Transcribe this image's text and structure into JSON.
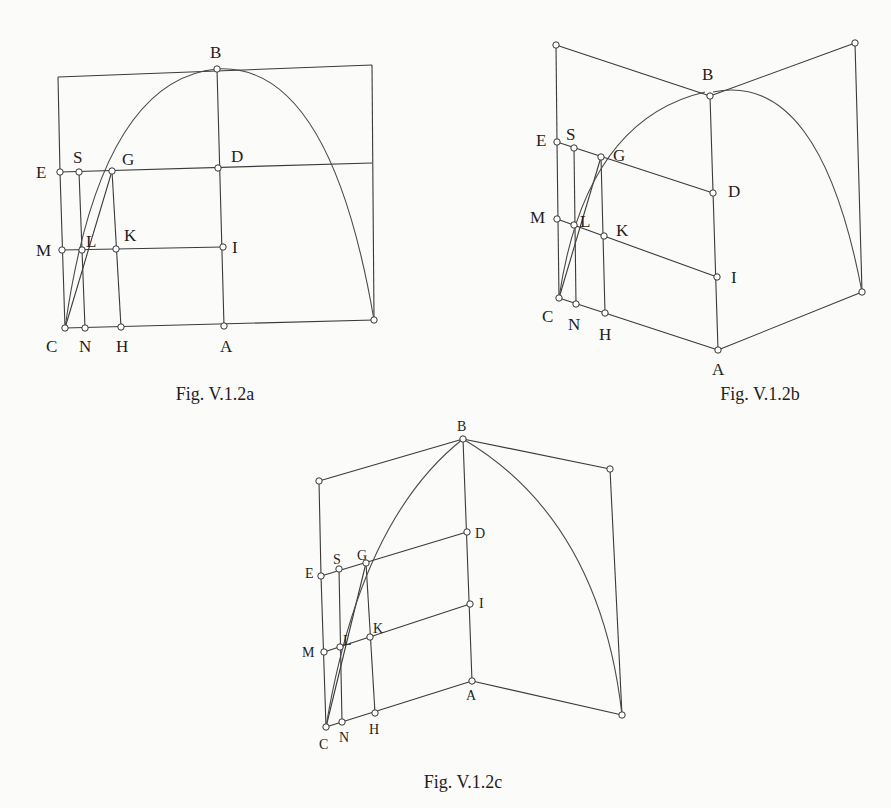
{
  "page": {
    "background": "#fbfbf9",
    "ink": "#333333"
  },
  "figures": [
    {
      "id": "a",
      "caption": "Fig. V.1.2a",
      "caption_pos": [
        215,
        400
      ],
      "label_class": "lbl",
      "edges": [
        [
          [
            58,
            77
          ],
          [
            372,
            65
          ]
        ],
        [
          [
            372,
            65
          ],
          [
            374,
            320
          ]
        ],
        [
          [
            58,
            77
          ],
          [
            60,
            172
          ]
        ],
        [
          [
            60,
            172
          ],
          [
            65,
            328
          ]
        ],
        [
          [
            65,
            328
          ],
          [
            374,
            320
          ]
        ],
        [
          [
            60,
            172
          ],
          [
            372,
            163
          ]
        ],
        [
          [
            62,
            250
          ],
          [
            223,
            247
          ]
        ],
        [
          [
            79,
            172
          ],
          [
            85,
            328
          ]
        ],
        [
          [
            112,
            171
          ],
          [
            121,
            327
          ]
        ],
        [
          [
            217,
            69
          ],
          [
            224,
            326
          ]
        ],
        [
          [
            65,
            328
          ],
          [
            112,
            171
          ]
        ]
      ],
      "curve": "M 65 328 Q 100 80 217 69 Q 330 62 374 320",
      "points": [
        {
          "name": "B",
          "xy": [
            217,
            69
          ],
          "label_xy": [
            210,
            58
          ]
        },
        {
          "name": "E",
          "xy": [
            60,
            172
          ],
          "label_xy": [
            36,
            178
          ]
        },
        {
          "name": "S",
          "xy": [
            79,
            172
          ],
          "label_xy": [
            73,
            163
          ]
        },
        {
          "name": "G",
          "xy": [
            112,
            171
          ],
          "label_xy": [
            122,
            165
          ]
        },
        {
          "name": "D",
          "xy": [
            218,
            168
          ],
          "label_xy": [
            231,
            162
          ]
        },
        {
          "name": "M",
          "xy": [
            62,
            250
          ],
          "label_xy": [
            36,
            256
          ]
        },
        {
          "name": "L",
          "xy": [
            82,
            250
          ],
          "label_xy": [
            86,
            247
          ]
        },
        {
          "name": "K",
          "xy": [
            116,
            249
          ],
          "label_xy": [
            124,
            241
          ]
        },
        {
          "name": "I",
          "xy": [
            223,
            247
          ],
          "label_xy": [
            232,
            253
          ]
        },
        {
          "name": "C",
          "xy": [
            65,
            328
          ],
          "label_xy": [
            46,
            352
          ]
        },
        {
          "name": "N",
          "xy": [
            85,
            328
          ],
          "label_xy": [
            79,
            352
          ]
        },
        {
          "name": "H",
          "xy": [
            121,
            327
          ],
          "label_xy": [
            116,
            352
          ]
        },
        {
          "name": "A",
          "xy": [
            224,
            326
          ],
          "label_xy": [
            220,
            352
          ]
        },
        {
          "name": "",
          "xy": [
            374,
            320
          ],
          "label_xy": null
        }
      ]
    },
    {
      "id": "b",
      "caption": "Fig. V.1.2b",
      "caption_pos": [
        760,
        400
      ],
      "label_class": "lbl",
      "edges": [
        [
          [
            556,
            45
          ],
          [
            710,
            96
          ]
        ],
        [
          [
            710,
            96
          ],
          [
            855,
            43
          ]
        ],
        [
          [
            556,
            45
          ],
          [
            557,
            142
          ]
        ],
        [
          [
            557,
            142
          ],
          [
            559,
            298
          ]
        ],
        [
          [
            855,
            43
          ],
          [
            862,
            292
          ]
        ],
        [
          [
            710,
            96
          ],
          [
            718,
            350
          ]
        ],
        [
          [
            559,
            298
          ],
          [
            718,
            350
          ]
        ],
        [
          [
            718,
            350
          ],
          [
            862,
            292
          ]
        ],
        [
          [
            557,
            142
          ],
          [
            713,
            193
          ]
        ],
        [
          [
            557,
            219
          ],
          [
            717,
            277
          ]
        ],
        [
          [
            574,
            148
          ],
          [
            576,
            304
          ]
        ],
        [
          [
            601,
            157
          ],
          [
            605,
            313
          ]
        ],
        [
          [
            559,
            298
          ],
          [
            601,
            157
          ]
        ]
      ],
      "curve": "M 559 298 Q 585 120 705 92 M 713 92 Q 820 70 862 292",
      "points": [
        {
          "name": "",
          "xy": [
            556,
            45
          ],
          "label_xy": null
        },
        {
          "name": "",
          "xy": [
            855,
            43
          ],
          "label_xy": null
        },
        {
          "name": "B",
          "xy": [
            710,
            96
          ],
          "label_xy": [
            702,
            80
          ]
        },
        {
          "name": "E",
          "xy": [
            557,
            142
          ],
          "label_xy": [
            536,
            146
          ]
        },
        {
          "name": "S",
          "xy": [
            574,
            148
          ],
          "label_xy": [
            566,
            140
          ]
        },
        {
          "name": "G",
          "xy": [
            601,
            157
          ],
          "label_xy": [
            613,
            161
          ]
        },
        {
          "name": "D",
          "xy": [
            713,
            193
          ],
          "label_xy": [
            728,
            197
          ]
        },
        {
          "name": "M",
          "xy": [
            557,
            219
          ],
          "label_xy": [
            530,
            223
          ]
        },
        {
          "name": "L",
          "xy": [
            574,
            225
          ],
          "label_xy": [
            580,
            227
          ]
        },
        {
          "name": "K",
          "xy": [
            604,
            236
          ],
          "label_xy": [
            616,
            236
          ]
        },
        {
          "name": "I",
          "xy": [
            717,
            277
          ],
          "label_xy": [
            731,
            283
          ]
        },
        {
          "name": "C",
          "xy": [
            559,
            298
          ],
          "label_xy": [
            542,
            322
          ]
        },
        {
          "name": "N",
          "xy": [
            576,
            304
          ],
          "label_xy": [
            568,
            330
          ]
        },
        {
          "name": "H",
          "xy": [
            605,
            313
          ],
          "label_xy": [
            599,
            340
          ]
        },
        {
          "name": "A",
          "xy": [
            718,
            350
          ],
          "label_xy": [
            712,
            375
          ]
        },
        {
          "name": "",
          "xy": [
            862,
            292
          ],
          "label_xy": null
        }
      ]
    },
    {
      "id": "c",
      "caption": "Fig. V.1.2c",
      "caption_pos": [
        463,
        788
      ],
      "label_class": "lbl lbl-c",
      "edges": [
        [
          [
            319,
            481
          ],
          [
            463,
            439
          ]
        ],
        [
          [
            463,
            439
          ],
          [
            610,
            469
          ]
        ],
        [
          [
            319,
            481
          ],
          [
            321,
            576
          ]
        ],
        [
          [
            321,
            576
          ],
          [
            326,
            727
          ]
        ],
        [
          [
            610,
            469
          ],
          [
            622,
            715
          ]
        ],
        [
          [
            463,
            439
          ],
          [
            472,
            681
          ]
        ],
        [
          [
            326,
            727
          ],
          [
            472,
            681
          ]
        ],
        [
          [
            472,
            681
          ],
          [
            622,
            715
          ]
        ],
        [
          [
            321,
            576
          ],
          [
            467,
            532
          ]
        ],
        [
          [
            324,
            652
          ],
          [
            470,
            604
          ]
        ],
        [
          [
            339,
            569
          ],
          [
            342,
            722
          ]
        ],
        [
          [
            366,
            563
          ],
          [
            375,
            713
          ]
        ],
        [
          [
            326,
            727
          ],
          [
            366,
            563
          ]
        ]
      ],
      "curve": "M 326 727 Q 360 520 463 439 Q 600 520 622 715",
      "points": [
        {
          "name": "",
          "xy": [
            319,
            481
          ],
          "label_xy": null
        },
        {
          "name": "",
          "xy": [
            610,
            469
          ],
          "label_xy": null
        },
        {
          "name": "B",
          "xy": [
            463,
            439
          ],
          "label_xy": [
            457,
            431
          ]
        },
        {
          "name": "D",
          "xy": [
            467,
            532
          ],
          "label_xy": [
            475,
            538
          ]
        },
        {
          "name": "E",
          "xy": [
            321,
            576
          ],
          "label_xy": [
            305,
            578
          ]
        },
        {
          "name": "S",
          "xy": [
            339,
            569
          ],
          "label_xy": [
            333,
            564
          ]
        },
        {
          "name": "G",
          "xy": [
            366,
            563
          ],
          "label_xy": [
            357,
            560
          ]
        },
        {
          "name": "I",
          "xy": [
            470,
            604
          ],
          "label_xy": [
            479,
            608
          ]
        },
        {
          "name": "K",
          "xy": [
            370,
            637
          ],
          "label_xy": [
            373,
            633
          ]
        },
        {
          "name": "L",
          "xy": [
            340,
            647
          ],
          "label_xy": [
            343,
            645
          ]
        },
        {
          "name": "M",
          "xy": [
            324,
            652
          ],
          "label_xy": [
            302,
            657
          ]
        },
        {
          "name": "A",
          "xy": [
            472,
            681
          ],
          "label_xy": [
            466,
            700
          ]
        },
        {
          "name": "H",
          "xy": [
            375,
            713
          ],
          "label_xy": [
            369,
            734
          ]
        },
        {
          "name": "N",
          "xy": [
            342,
            722
          ],
          "label_xy": [
            339,
            742
          ]
        },
        {
          "name": "C",
          "xy": [
            326,
            727
          ],
          "label_xy": [
            319,
            749
          ]
        },
        {
          "name": "",
          "xy": [
            622,
            715
          ],
          "label_xy": null
        }
      ]
    }
  ]
}
